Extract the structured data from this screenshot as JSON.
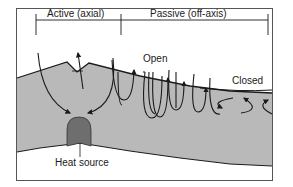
{
  "diagram": {
    "type": "hydrothermal-circulation-cross-section",
    "header": {
      "active_label": "Active (axial)",
      "passive_label": "Passive (off-axis)"
    },
    "labels": {
      "open": "Open",
      "closed": "Closed",
      "heat_source": "Heat source"
    },
    "colors": {
      "background": "#ffffff",
      "crust_fill": "#b9b9b9",
      "heat_source_fill": "#6e6e6e",
      "lines": "#1a1a1a",
      "frame": "#555555"
    }
  }
}
